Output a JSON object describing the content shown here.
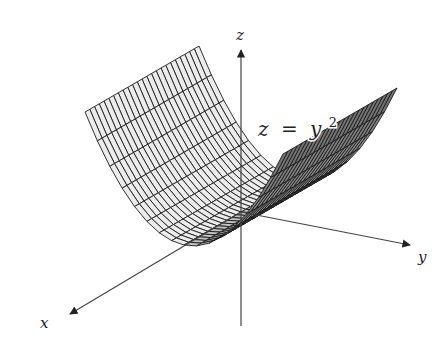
{
  "figure": {
    "type": "3d-surface-plot",
    "equation": {
      "lhs": "z",
      "eq": "=",
      "base": "y",
      "exponent": "2",
      "text": "z = y^2"
    },
    "axes": {
      "x": {
        "label": "x"
      },
      "y": {
        "label": "y"
      },
      "z": {
        "label": "z"
      }
    },
    "colors": {
      "background": "#ffffff",
      "surface_fill": "#e8e8e8",
      "mesh_line": "#1a1a1a",
      "axis_line": "#444444"
    }
  },
  "chart_data": {
    "type": "surface",
    "function": "z = y^2",
    "surface_kind": "parabolic cylinder",
    "xlabel": "x",
    "ylabel": "y",
    "zlabel": "z",
    "x_range": [
      -1,
      1
    ],
    "y_range": [
      -1,
      1
    ],
    "z_range": [
      0,
      1
    ],
    "mesh": {
      "x_divisions": 24,
      "y_divisions": 16
    },
    "grid": false,
    "legend": null
  },
  "projection": {
    "origin": [
      241,
      212
    ],
    "ex": [
      -57,
      33
    ],
    "ey": [
      99,
      21
    ],
    "ez": [
      0,
      -112
    ]
  },
  "axes_screen": {
    "z": {
      "from": [
        241,
        326
      ],
      "to": [
        241,
        50
      ],
      "label_pos": [
        236,
        40
      ]
    },
    "x": {
      "from": [
        241,
        212
      ],
      "to": [
        70,
        314
      ],
      "label_pos": [
        40,
        328
      ]
    },
    "y": {
      "from": [
        241,
        212
      ],
      "to": [
        410,
        245
      ],
      "label_pos": [
        418,
        262
      ]
    },
    "equation_pos": [
      258,
      136
    ]
  }
}
